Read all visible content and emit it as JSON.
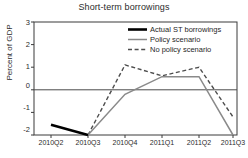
{
  "chart_data": {
    "type": "line",
    "title": "Short-term borrowings",
    "xlabel": "",
    "ylabel": "Percent of GDP",
    "categories": [
      "2010Q2",
      "2010Q3",
      "2010Q4",
      "2011Q1",
      "2011Q2",
      "2011Q3"
    ],
    "ylim": [
      -2,
      3
    ],
    "yticks": [
      "3",
      "2",
      "1",
      "0",
      "-1",
      "-2"
    ],
    "ytick_values": [
      3,
      2,
      1,
      0,
      -1,
      -2
    ],
    "grid": false,
    "zero_line": true,
    "legend_position": "upper right",
    "series": [
      {
        "name": "Actual ST borrowings",
        "style": "solid-thick",
        "color": "#000000",
        "values": [
          -1.55,
          -2.0,
          null,
          null,
          null,
          null
        ]
      },
      {
        "name": "Policy scenario",
        "style": "solid-thin",
        "color": "#8a8a8a",
        "values": [
          null,
          -2.0,
          -0.2,
          0.58,
          0.58,
          -2.0
        ]
      },
      {
        "name": "No policy scenario",
        "style": "dashed",
        "color": "#4d4d4d",
        "values": [
          null,
          -2.0,
          1.1,
          0.62,
          1.0,
          -1.2
        ]
      }
    ]
  },
  "legend": {
    "items": [
      {
        "label": "Actual ST borrowings"
      },
      {
        "label": "Policy scenario"
      },
      {
        "label": "No policy scenario"
      }
    ]
  },
  "colors": {
    "actual": "#000000",
    "policy": "#8a8a8a",
    "no_policy": "#4d4d4d",
    "frame": "#3a3a3a",
    "background": "#ffffff"
  }
}
